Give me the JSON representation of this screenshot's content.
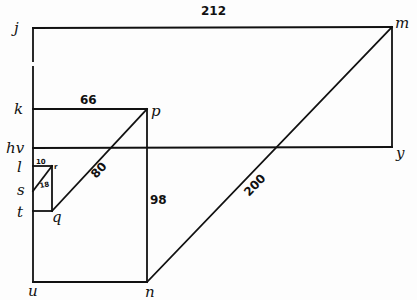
{
  "diagram": {
    "title": "",
    "points": {
      "j": "j",
      "m": "m",
      "k": "k",
      "p": "p",
      "hv": "hv",
      "y": "y",
      "l": "l",
      "r": "r",
      "s": "s",
      "t": "t",
      "q": "q",
      "u": "u",
      "n": "n"
    },
    "measurements": {
      "jm": "212",
      "kp": "66",
      "pn": "98",
      "qp": "80",
      "nm": "200",
      "lr": "10",
      "sr": "18"
    },
    "line_color": "#111111",
    "background_color": "#fdfdfd"
  }
}
